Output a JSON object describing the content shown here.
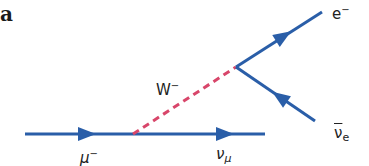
{
  "panel_label": "a",
  "colors": {
    "fermion": "#2a5ea8",
    "boson": "#d8466a",
    "text": "#222222"
  },
  "particles": {
    "muon": {
      "symbol": "μ",
      "sup": "−"
    },
    "muon_neutrino": {
      "symbol": "ν",
      "sub": "μ"
    },
    "w_boson": {
      "symbol": "W",
      "sup": "−"
    },
    "electron": {
      "symbol": "e",
      "sup": "−"
    },
    "electron_antineutrino": {
      "symbol": "ν",
      "sub": "e"
    }
  }
}
